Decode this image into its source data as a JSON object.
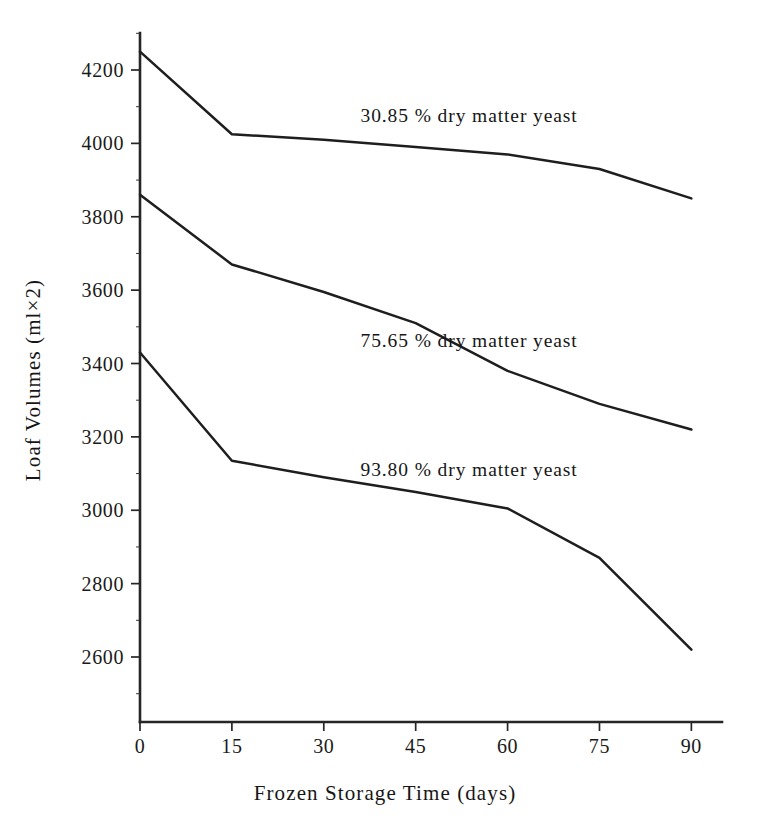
{
  "chart_data": {
    "type": "line",
    "title": "",
    "xlabel": "Frozen Storage Time (days)",
    "ylabel": "Loaf Volumes (ml×2)",
    "x": [
      0,
      15,
      30,
      45,
      60,
      75,
      90
    ],
    "xticklabels": [
      "0",
      "15",
      "30",
      "45",
      "60",
      "75",
      "90"
    ],
    "yticks": [
      2600,
      2800,
      3000,
      3200,
      3400,
      3600,
      3800,
      4000,
      4200
    ],
    "yticklabels": [
      "2600",
      "2800",
      "3000",
      "3200",
      "3400",
      "3600",
      "3800",
      "4000",
      "4200"
    ],
    "xlim": [
      0,
      95
    ],
    "ylim": [
      2480,
      4290
    ],
    "grid": false,
    "legend_position": "inline-annotations",
    "series": [
      {
        "name": "30.85 % dry matter yeast",
        "label": "30.85 % dry matter yeast",
        "values": [
          4250,
          4025,
          4010,
          3990,
          3970,
          3930,
          3850
        ],
        "label_x": 36,
        "label_y": 4075
      },
      {
        "name": "75.65 % dry matter yeast",
        "label": "75.65 % dry matter yeast",
        "values": [
          3860,
          3670,
          3595,
          3510,
          3380,
          3290,
          3220
        ],
        "label_x": 36,
        "label_y": 3460
      },
      {
        "name": "93.80 % dry matter yeast",
        "label": "93.80 % dry matter yeast",
        "values": [
          3430,
          3135,
          3090,
          3050,
          3005,
          2870,
          2620
        ],
        "label_x": 36,
        "label_y": 3110
      }
    ]
  }
}
